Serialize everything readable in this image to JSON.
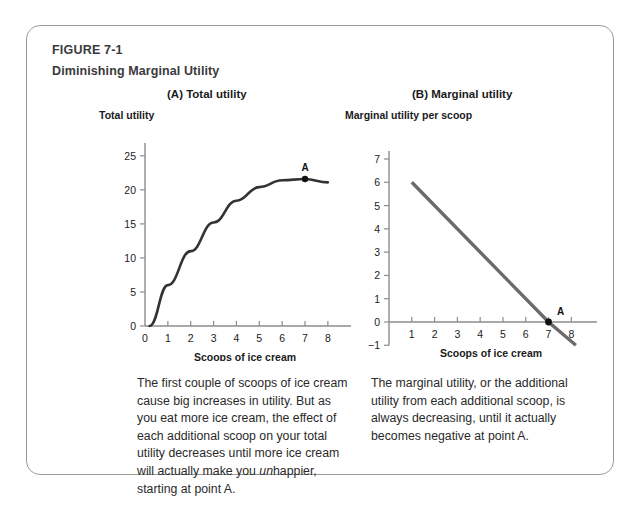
{
  "figure": {
    "label": "FIGURE 7-1",
    "title": "Diminishing Marginal Utility",
    "frame_color": "#9a9a9a",
    "background": "#ffffff"
  },
  "panels": [
    {
      "id": "A",
      "title": "(A) Total utility",
      "caption": "The first couple of scoops of ice cream cause big increases in utility. But as you eat more ice cream, the effect of each additional scoop on your total utility decreases until more ice cream will actually make you ",
      "caption_italic": "un",
      "caption_tail": "happier, starting at point A."
    },
    {
      "id": "B",
      "title": "(B) Marginal utility",
      "caption": "The marginal utility, or the additional utility from each additional scoop, is always decreasing, until it actually becomes negative at point A."
    }
  ],
  "chart_data": [
    {
      "type": "line",
      "title": "(A) Total utility",
      "xlabel": "Scoops of ice cream",
      "ylabel": "Total utility",
      "xlim": [
        0,
        8.4
      ],
      "ylim": [
        0,
        26
      ],
      "xticks": [
        "0",
        "1",
        "2",
        "3",
        "4",
        "5",
        "6",
        "7",
        "8"
      ],
      "yticks": [
        "0",
        "5",
        "10",
        "15",
        "20",
        "25"
      ],
      "grid": false,
      "legend": "none",
      "line_color": "#333333",
      "series": [
        {
          "name": "Total utility",
          "x": [
            0.2,
            1,
            2,
            3,
            4,
            5,
            6,
            7,
            8
          ],
          "values": [
            0,
            6,
            11,
            15.2,
            18.4,
            20.4,
            21.4,
            21.6,
            21.1
          ]
        }
      ],
      "annotations": [
        {
          "label": "A",
          "x": 7,
          "y": 21.6,
          "marker": "dot"
        }
      ]
    },
    {
      "type": "line",
      "title": "(B) Marginal utility",
      "xlabel": "Scoops of ice cream",
      "ylabel": "Marginal utility per scoop",
      "xlim": [
        0,
        8.6
      ],
      "ylim": [
        -1,
        7
      ],
      "xticks": [
        "1",
        "2",
        "3",
        "4",
        "5",
        "6",
        "7",
        "8"
      ],
      "yticks": [
        "-1",
        "0",
        "1",
        "2",
        "3",
        "4",
        "5",
        "6",
        "7"
      ],
      "grid": false,
      "legend": "none",
      "line_color": "#6b6b6b",
      "series": [
        {
          "name": "Marginal utility",
          "x": [
            1,
            7,
            8.2
          ],
          "values": [
            6,
            0,
            -1
          ]
        }
      ],
      "annotations": [
        {
          "label": "A",
          "x": 7,
          "y": 0,
          "marker": "dot"
        }
      ]
    }
  ]
}
